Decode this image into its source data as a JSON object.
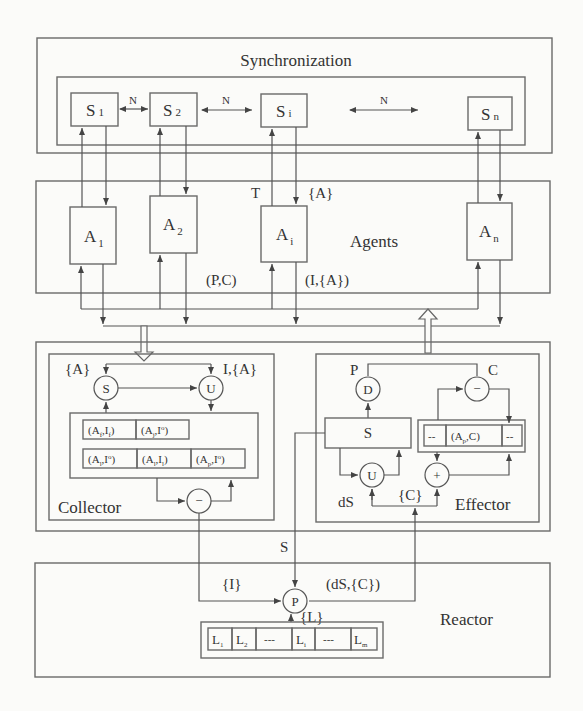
{
  "diagram": {
    "sync": {
      "title": "Synchronization",
      "nodes": [
        "S1",
        "S2",
        "Si",
        "Sn"
      ],
      "node_base": [
        "S",
        "S",
        "S",
        "S"
      ],
      "node_sub": [
        "1",
        "2",
        "i",
        "n"
      ],
      "link_label": "N"
    },
    "agents": {
      "title": "Agents",
      "node_base": [
        "A",
        "A",
        "A",
        "A"
      ],
      "node_sub": [
        "1",
        "2",
        "i",
        "n"
      ],
      "label_T": "T",
      "label_A_set": "{A}",
      "label_PC": "(P,C)",
      "label_IA": "(I,{A})"
    },
    "collector": {
      "title": "Collector",
      "label_A_set": "{A}",
      "label_I_A": "I,{A}",
      "op_select": "S",
      "op_union": "U",
      "op_minus": "−",
      "memory_row1": [
        {
          "a": "A",
          "as": "f",
          "i": "I",
          "is": "f",
          "sup": false
        },
        {
          "a": "A",
          "as": "j",
          "i": "I",
          "is": "o",
          "sup": true
        }
      ],
      "memory_row2": [
        {
          "a": "A",
          "as": "l",
          "i": "I",
          "is": "o",
          "sup": true
        },
        {
          "a": "A",
          "as": "l",
          "i": "I",
          "is": "l",
          "sup": false
        },
        {
          "a": "A",
          "as": "p",
          "i": "I",
          "is": "o",
          "sup": true
        }
      ]
    },
    "effector": {
      "title": "Effector",
      "label_P": "P",
      "label_C": "C",
      "op_decide": "D",
      "op_minus": "−",
      "op_union": "U",
      "op_plus": "+",
      "state_box": "S",
      "memory_cells": [
        "--",
        "(Ap,C)",
        "--"
      ],
      "memory_mid_base": "(A",
      "memory_mid_sub": "p",
      "memory_mid_tail": ",C)",
      "label_dS": "dS",
      "label_C_set": "{C}"
    },
    "links": {
      "label_S": "S",
      "label_I_set": "{I}",
      "label_dS_C": "(dS,{C})",
      "label_L_set": "{L}"
    },
    "reactor": {
      "title": "Reactor",
      "op_process": "P",
      "library_base": [
        "L",
        "L",
        "---",
        "L",
        "---",
        "L"
      ],
      "library_sub": [
        "1",
        "2",
        "",
        "i",
        "",
        "m"
      ]
    }
  }
}
